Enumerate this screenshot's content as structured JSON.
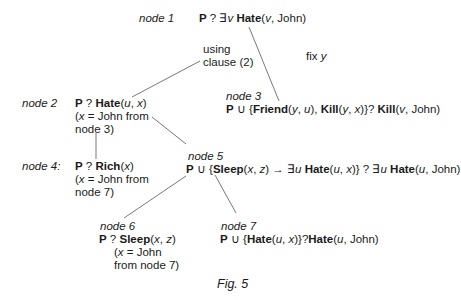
{
  "nodes": [
    {
      "id": "node1",
      "label": "node 1",
      "goal": "P ? ∃v Hate(v, John)"
    },
    {
      "id": "node2",
      "label": "node 2",
      "goal": "P ? Hate(u, x)",
      "note": [
        "(x = John from",
        "node 3)"
      ]
    },
    {
      "id": "node3",
      "label": "node 3",
      "goal": "P ∪ {Friend(y, u), Kill(y, x)} ? Kill(v, John)"
    },
    {
      "id": "node4",
      "label": "node 4:",
      "goal": "P ? Rich(x)",
      "note": [
        "(x = John from",
        "node 7)"
      ]
    },
    {
      "id": "node5",
      "label": "node 5",
      "goal": "P ∪ {Sleep(x, z) → ∃u Hate(u, x)} ? ∃u Hate(u, John)"
    },
    {
      "id": "node6",
      "label": "node 6",
      "goal": "P ? Sleep(x, z)",
      "note": [
        "(x = John",
        "from node 7)"
      ]
    },
    {
      "id": "node7",
      "label": "node 7",
      "goal": "P ∪ {Hate(u, x)} ? Hate(u, John)"
    }
  ],
  "annotations": {
    "using_clause": [
      "using",
      "clause (2)"
    ],
    "fix_y": "fix y"
  },
  "edges": [
    [
      "node1",
      "node3"
    ],
    [
      "node2",
      "node1"
    ],
    [
      "node2",
      "node4"
    ],
    [
      "node2",
      "node5"
    ],
    [
      "node5",
      "node6"
    ],
    [
      "node5",
      "node7"
    ]
  ],
  "caption": "Fig. 5"
}
